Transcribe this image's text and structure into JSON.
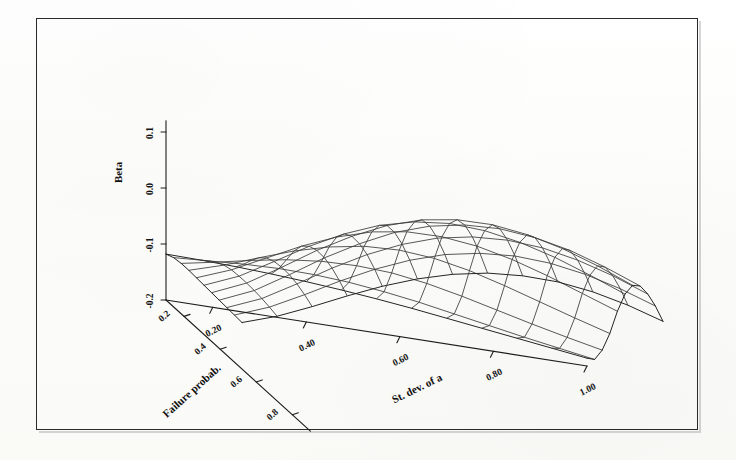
{
  "figure": {
    "kind": "3d-surface-wireframe",
    "border_color": "#2a2a2a",
    "background_color": "#ffffff",
    "mesh_color": "#3a3a3a",
    "axis_color": "#1d1d1d",
    "text_color": "#141414"
  },
  "chart_data": {
    "type": "surface",
    "title": "",
    "xlabel": "St. dev. of a",
    "ylabel": "Failure probab.",
    "zlabel": "Beta",
    "grid": false,
    "legend": "none",
    "projection": "3d-wireframe",
    "x_ticks": [
      "0.20",
      "0.40",
      "0.60",
      "0.80",
      "1.00"
    ],
    "x_tick_values": [
      0.2,
      0.4,
      0.6,
      0.8,
      1.0
    ],
    "y_ticks": [
      "0.2",
      "0.4",
      "0.6",
      "0.8"
    ],
    "y_tick_values": [
      0.2,
      0.4,
      0.6,
      0.8
    ],
    "z_ticks": [
      "0.1",
      "0.0",
      "-0.1",
      "-0.2"
    ],
    "z_tick_values": [
      0.1,
      0.0,
      -0.1,
      -0.2
    ],
    "xlim": [
      0.1,
      1.0
    ],
    "ylim": [
      0.1,
      0.9
    ],
    "zlim": [
      -0.2,
      0.12
    ],
    "nx": 13,
    "ny": 11,
    "z_matrix": [
      [
        -0.118,
        -0.119,
        -0.121,
        -0.124,
        -0.128,
        -0.133,
        -0.139,
        -0.146,
        -0.154,
        -0.162,
        -0.17,
        -0.178,
        -0.186
      ],
      [
        -0.112,
        -0.108,
        -0.104,
        -0.102,
        -0.103,
        -0.107,
        -0.114,
        -0.123,
        -0.134,
        -0.145,
        -0.156,
        -0.166,
        -0.176
      ],
      [
        -0.11,
        -0.098,
        -0.085,
        -0.074,
        -0.067,
        -0.065,
        -0.068,
        -0.077,
        -0.09,
        -0.105,
        -0.12,
        -0.134,
        -0.147
      ],
      [
        -0.11,
        -0.091,
        -0.068,
        -0.046,
        -0.029,
        -0.018,
        -0.015,
        -0.02,
        -0.032,
        -0.049,
        -0.068,
        -0.087,
        -0.105
      ],
      [
        -0.111,
        -0.087,
        -0.056,
        -0.025,
        0.001,
        0.02,
        0.03,
        0.031,
        0.024,
        0.01,
        -0.009,
        -0.031,
        -0.053
      ],
      [
        -0.112,
        -0.086,
        -0.05,
        -0.013,
        0.019,
        0.044,
        0.06,
        0.067,
        0.064,
        0.053,
        0.036,
        0.014,
        -0.01
      ],
      [
        -0.113,
        -0.086,
        -0.048,
        -0.008,
        0.027,
        0.056,
        0.076,
        0.086,
        0.087,
        0.079,
        0.064,
        0.043,
        0.018
      ],
      [
        -0.114,
        -0.087,
        -0.049,
        -0.009,
        0.026,
        0.056,
        0.077,
        0.089,
        0.092,
        0.086,
        0.073,
        0.053,
        0.029
      ],
      [
        -0.115,
        -0.089,
        -0.053,
        -0.015,
        0.019,
        0.047,
        0.068,
        0.08,
        0.084,
        0.08,
        0.068,
        0.05,
        0.027
      ],
      [
        -0.116,
        -0.092,
        -0.06,
        -0.026,
        0.005,
        0.031,
        0.051,
        0.063,
        0.068,
        0.065,
        0.055,
        0.039,
        0.018
      ],
      [
        -0.117,
        -0.096,
        -0.069,
        -0.04,
        -0.013,
        0.01,
        0.028,
        0.04,
        0.045,
        0.044,
        0.036,
        0.022,
        0.003
      ]
    ]
  },
  "axes": {
    "z_axis": {
      "name": "Beta",
      "label": "Beta"
    },
    "y_axis": {
      "name": "Failure probab.",
      "label": "Failure probab."
    },
    "x_axis": {
      "name": "St. dev. of a",
      "label": "St. dev. of a"
    }
  }
}
